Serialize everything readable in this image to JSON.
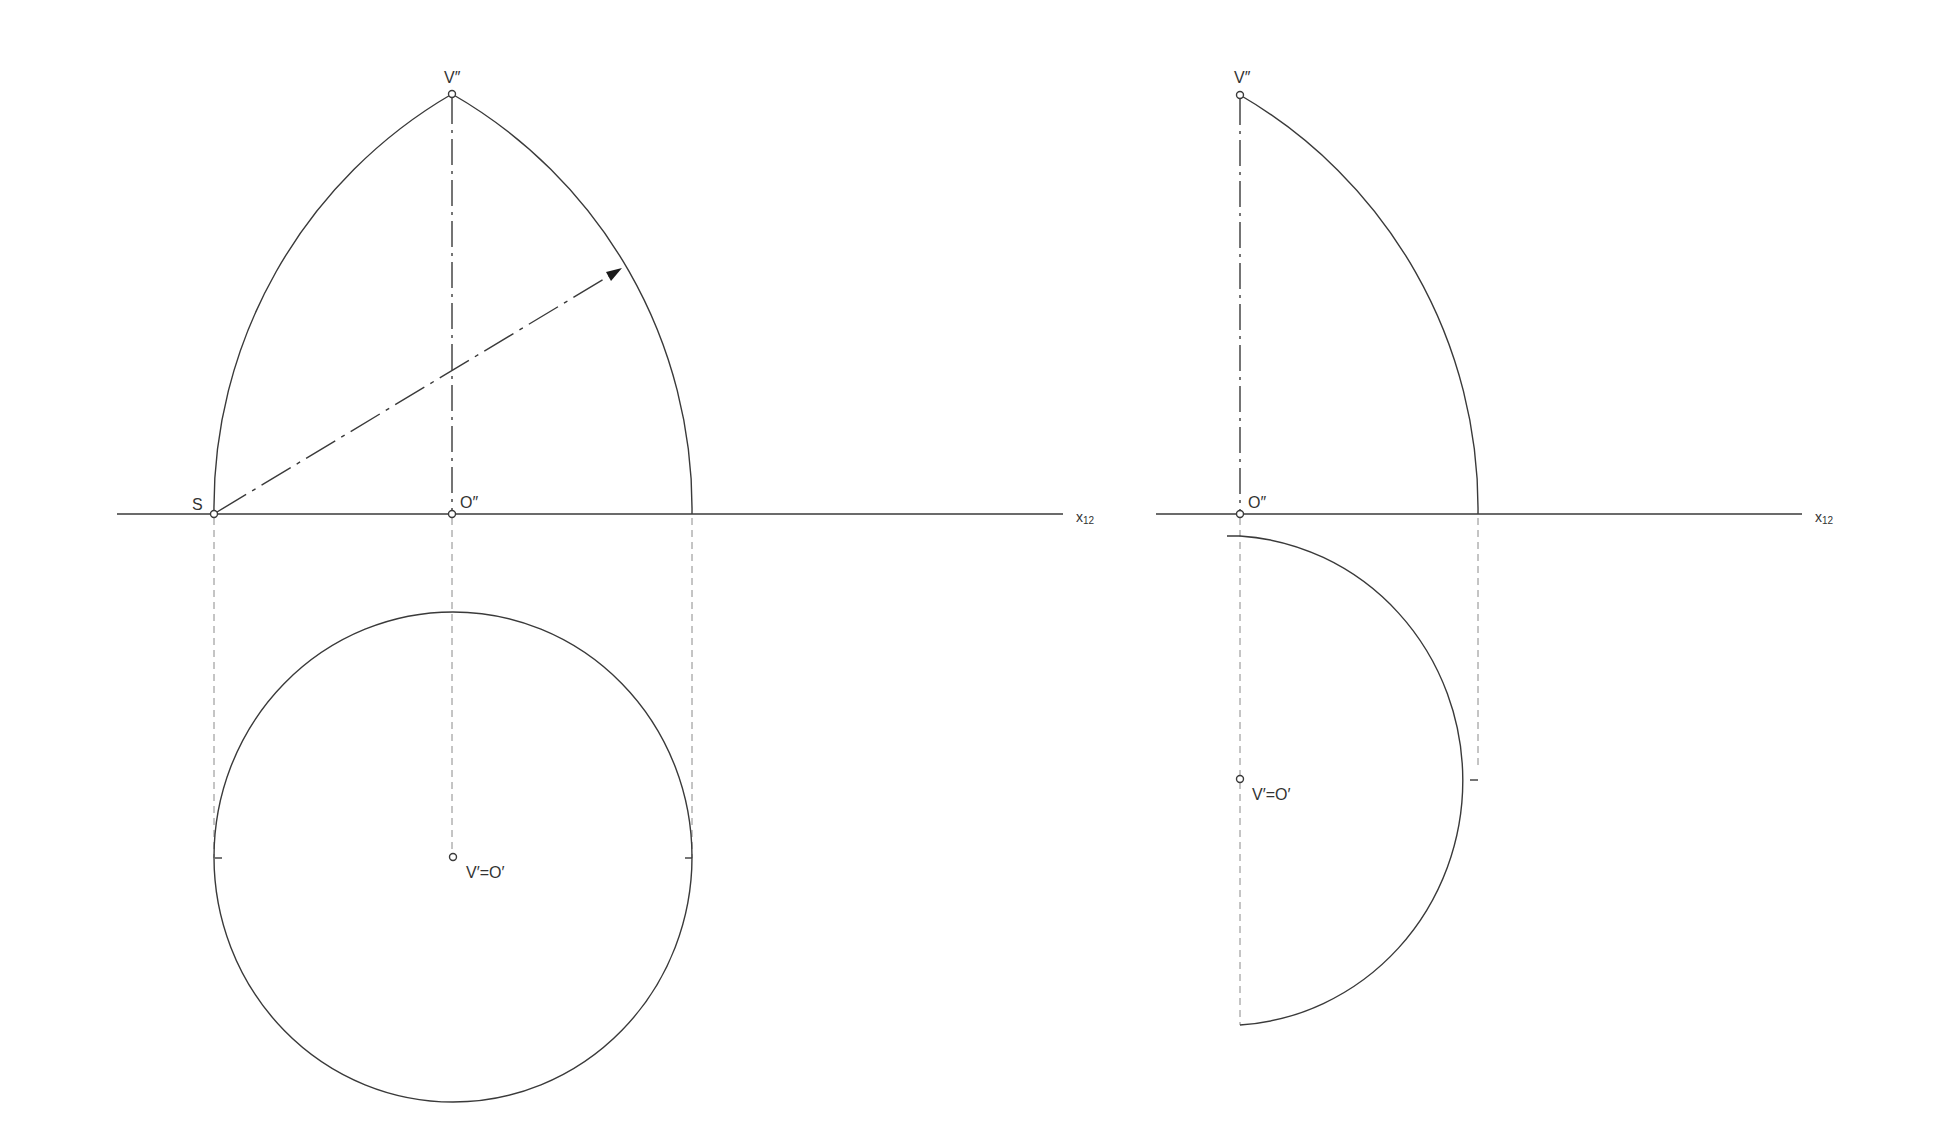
{
  "left_view": {
    "labels": {
      "apex_front": "V″",
      "start_point": "S",
      "origin_front": "O″",
      "axis": "x",
      "axis_sub": "12",
      "apex_top": "V′=O′"
    }
  },
  "right_view": {
    "labels": {
      "apex_front": "V″",
      "origin_front": "O″",
      "axis": "x",
      "axis_sub": "12",
      "apex_top": "V′=O′"
    }
  },
  "colors": {
    "line": "#3a3a3a",
    "dashed": "#8a8a8a"
  }
}
